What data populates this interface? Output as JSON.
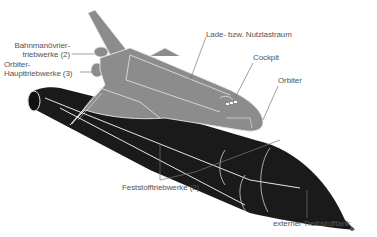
{
  "diagram": {
    "colors": {
      "background": "#ffffff",
      "orbiter": "#8c8c8c",
      "tank": "#1a1a1a",
      "outline": "#e6e6e6",
      "label_text": "#555555",
      "leader_line": "#777777"
    },
    "labels": [
      {
        "id": "bahnmanoevrier",
        "line1": "Bahnmanövrier-",
        "line2": "triebwerke (2)"
      },
      {
        "id": "haupttriebwerke",
        "line1": "Orbiter-",
        "line2": "Haupttriebwerke (3)"
      },
      {
        "id": "nutzlastraum",
        "text": "Lade- bzw. Nutzlastraum"
      },
      {
        "id": "cockpit",
        "text": "Cockpit"
      },
      {
        "id": "orbiter",
        "text": "Orbiter"
      },
      {
        "id": "feststoff",
        "text": "Feststofftriebwerke (2)"
      },
      {
        "id": "tank",
        "text": "externer Treibstofftank"
      }
    ]
  }
}
